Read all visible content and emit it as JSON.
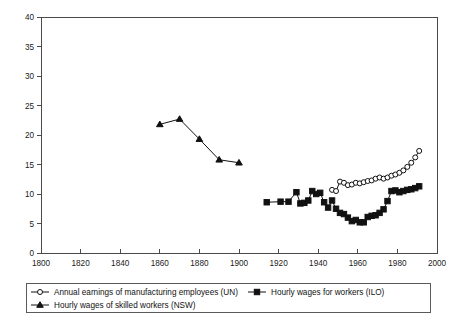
{
  "chart_data": {
    "type": "line",
    "title": "",
    "subtitle": "",
    "xlabel": "",
    "ylabel": "",
    "xlim": [
      1800,
      2000
    ],
    "ylim": [
      0,
      40
    ],
    "xticks": [
      1800,
      1820,
      1840,
      1860,
      1880,
      1900,
      1920,
      1940,
      1960,
      1980,
      2000
    ],
    "yticks": [
      0,
      5,
      10,
      15,
      20,
      25,
      30,
      35,
      40
    ],
    "grid": false,
    "legend_position": "bottom",
    "series": [
      {
        "name": "Annual earnings of manufacturing employees (UN)",
        "marker": "open-circle",
        "x": [
          1947,
          1949,
          1951,
          1953,
          1955,
          1957,
          1959,
          1961,
          1963,
          1965,
          1967,
          1969,
          1971,
          1973,
          1975,
          1977,
          1979,
          1981,
          1983,
          1985,
          1987,
          1989,
          1991
        ],
        "values": [
          10.7,
          10.5,
          12.1,
          11.9,
          11.5,
          11.6,
          11.9,
          11.8,
          12.0,
          12.2,
          12.3,
          12.6,
          12.8,
          12.6,
          12.8,
          13.1,
          13.3,
          13.6,
          14.0,
          14.6,
          15.3,
          16.2,
          17.3
        ]
      },
      {
        "name": "Hourly wages for workers (ILO)",
        "marker": "filled-square",
        "x": [
          1914,
          1921,
          1925,
          1929,
          1931,
          1933,
          1935,
          1937,
          1939,
          1941,
          1943,
          1945,
          1947,
          1949,
          1951,
          1953,
          1955,
          1957,
          1959,
          1961,
          1963,
          1965,
          1967,
          1969,
          1971,
          1973,
          1975,
          1977,
          1979,
          1981,
          1983,
          1985,
          1987,
          1989,
          1991
        ],
        "values": [
          8.6,
          8.7,
          8.7,
          10.3,
          8.4,
          8.5,
          8.9,
          10.5,
          10.0,
          10.2,
          8.6,
          7.7,
          8.9,
          7.5,
          6.8,
          6.6,
          6.0,
          5.4,
          5.6,
          5.2,
          5.2,
          6.1,
          6.3,
          6.4,
          6.8,
          7.4,
          8.8,
          10.5,
          10.6,
          10.3,
          10.5,
          10.7,
          10.8,
          11.0,
          11.3
        ]
      },
      {
        "name": "Hourly wages of skilled workers (NSW)",
        "marker": "filled-triangle",
        "x": [
          1860,
          1870,
          1880,
          1890,
          1900
        ],
        "values": [
          21.8,
          22.7,
          19.3,
          15.8,
          15.3
        ]
      }
    ]
  },
  "axes": {
    "y_tick_labels": [
      "0",
      "5",
      "10",
      "15",
      "20",
      "25",
      "30",
      "35",
      "40"
    ],
    "x_tick_labels": [
      "1800",
      "1820",
      "1840",
      "1860",
      "1880",
      "1900",
      "1920",
      "1940",
      "1960",
      "1980",
      "2000"
    ]
  },
  "legend": {
    "entries": [
      {
        "label": "Annual earnings of manufacturing employees (UN)",
        "marker": "open-circle"
      },
      {
        "label": "Hourly wages for workers (ILO)",
        "marker": "filled-square"
      },
      {
        "label": "Hourly wages of skilled workers (NSW)",
        "marker": "filled-triangle"
      }
    ]
  },
  "colors": {
    "line": "#111111",
    "axis": "#4a4a4a",
    "background": "#ffffff",
    "legend_border": "#5a5a5a"
  }
}
